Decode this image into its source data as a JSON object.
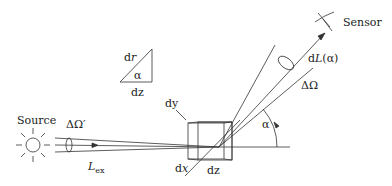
{
  "diagram": {
    "labels": {
      "sensor": "Sensor",
      "source": "Source",
      "dL_prefix": "d",
      "dL_var": "L",
      "dL_arg": "(α)",
      "delta_omega": "ΔΩ",
      "delta_omega_prime": "ΔΩ′",
      "L_ex_var": "L",
      "L_ex_sub": "ex",
      "alpha_main": "α",
      "dy": "dy",
      "dx_d": "d",
      "dx_var": "x",
      "dz_cube": "dz",
      "triangle_dr_d": "d",
      "triangle_dr_var": "r",
      "triangle_alpha": "α",
      "triangle_dz": "dz"
    },
    "colors": {
      "stroke": "#333333",
      "text": "#222222",
      "background": "#ffffff"
    }
  }
}
